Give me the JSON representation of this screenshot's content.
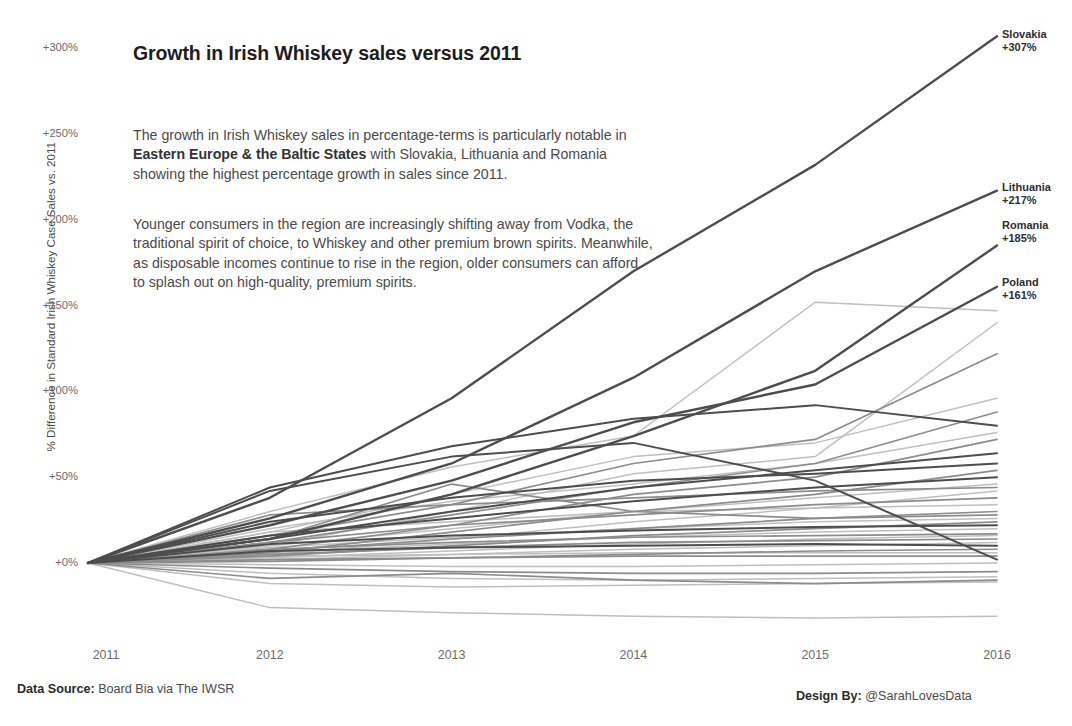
{
  "title": "Growth in Irish Whiskey sales versus 2011",
  "paragraphs": {
    "p1_a": "The growth in Irish Whiskey sales in percentage-terms is particularly notable in ",
    "p1_b": "Eastern Europe & the Baltic States",
    "p1_c": " with Slovakia, Lithuania and Romania showing the highest percentage growth in sales since 2011.",
    "p2": "Younger consumers in the region are increasingly shifting away from Vodka, the traditional spirit of choice, to Whiskey and other premium brown spirits. Meanwhile, as disposable incomes continue to rise in the region, older consumers can afford to splash out on high-quality, premium spirits."
  },
  "footer": {
    "source_label": "Data Source:",
    "source_value": " Board Bia via The IWSR",
    "design_label": "Design By:",
    "design_value": " @SarahLovesData"
  },
  "chart_data": {
    "type": "line",
    "title": "Growth in Irish Whiskey sales versus 2011",
    "xlabel": "",
    "ylabel": "% Difference in Standard Irish Whiskey Case Sales vs. 2011",
    "x": [
      "2011",
      "2012",
      "2013",
      "2014",
      "2015",
      "2016"
    ],
    "xtick_labels": [
      "2011",
      "2012",
      "2013",
      "2014",
      "2015",
      "2016"
    ],
    "ytick_labels": [
      "+0%",
      "+50%",
      "+100%",
      "+150%",
      "+200%",
      "+250%",
      "+300%"
    ],
    "ytick_values": [
      0,
      50,
      100,
      150,
      200,
      250,
      300
    ],
    "ylim": [
      -40,
      310
    ],
    "grid": false,
    "legend": "none",
    "annotations": [
      {
        "name": "Slovakia",
        "value": "+307%"
      },
      {
        "name": "Lithuania",
        "value": "+217%"
      },
      {
        "name": "Romania",
        "value": "+185%"
      },
      {
        "name": "Poland",
        "value": "+161%"
      }
    ],
    "colors": {
      "dark": "#4d4d4d",
      "mid": "#8c8c8c",
      "light": "#bfbfbf",
      "background": "#ffffff",
      "text": "#4a4a4a"
    },
    "series": [
      {
        "name": "Slovakia",
        "values": [
          0,
          38,
          96,
          170,
          232,
          307
        ],
        "tone": "dark",
        "highlight": true
      },
      {
        "name": "Lithuania",
        "values": [
          0,
          26,
          58,
          108,
          170,
          217
        ],
        "tone": "dark",
        "highlight": true
      },
      {
        "name": "Romania",
        "values": [
          0,
          14,
          40,
          74,
          112,
          185
        ],
        "tone": "dark",
        "highlight": true
      },
      {
        "name": "Poland",
        "values": [
          0,
          22,
          48,
          82,
          104,
          161
        ],
        "tone": "dark",
        "highlight": true
      },
      {
        "name": "Series 5",
        "values": [
          0,
          30,
          56,
          74,
          152,
          147
        ],
        "tone": "light",
        "highlight": false
      },
      {
        "name": "Series 6",
        "values": [
          0,
          10,
          30,
          52,
          62,
          140
        ],
        "tone": "light",
        "highlight": false
      },
      {
        "name": "Series 7",
        "values": [
          0,
          16,
          34,
          58,
          72,
          122
        ],
        "tone": "mid",
        "highlight": false
      },
      {
        "name": "Series 8",
        "values": [
          0,
          18,
          40,
          62,
          70,
          96
        ],
        "tone": "light",
        "highlight": false
      },
      {
        "name": "Series 9",
        "values": [
          0,
          12,
          28,
          44,
          58,
          88
        ],
        "tone": "mid",
        "highlight": false
      },
      {
        "name": "Series 10",
        "values": [
          0,
          44,
          68,
          84,
          92,
          80
        ],
        "tone": "dark",
        "highlight": false
      },
      {
        "name": "Series 11",
        "values": [
          0,
          20,
          36,
          46,
          58,
          76
        ],
        "tone": "light",
        "highlight": false
      },
      {
        "name": "Series 12",
        "values": [
          0,
          8,
          22,
          40,
          50,
          72
        ],
        "tone": "mid",
        "highlight": false
      },
      {
        "name": "Series 13",
        "values": [
          0,
          14,
          30,
          44,
          54,
          64
        ],
        "tone": "dark",
        "highlight": false
      },
      {
        "name": "Series 14",
        "values": [
          0,
          24,
          38,
          48,
          52,
          58
        ],
        "tone": "dark",
        "highlight": false
      },
      {
        "name": "Series 15",
        "values": [
          0,
          6,
          18,
          30,
          40,
          54
        ],
        "tone": "mid",
        "highlight": false
      },
      {
        "name": "Series 16",
        "values": [
          0,
          16,
          26,
          36,
          44,
          50
        ],
        "tone": "dark",
        "highlight": false
      },
      {
        "name": "Series 17",
        "values": [
          0,
          10,
          20,
          30,
          38,
          46
        ],
        "tone": "light",
        "highlight": false
      },
      {
        "name": "Series 18",
        "values": [
          0,
          28,
          34,
          38,
          42,
          44
        ],
        "tone": "mid",
        "highlight": false
      },
      {
        "name": "Series 19",
        "values": [
          0,
          5,
          14,
          24,
          32,
          42
        ],
        "tone": "light",
        "highlight": false
      },
      {
        "name": "Series 20",
        "values": [
          0,
          12,
          22,
          28,
          34,
          38
        ],
        "tone": "mid",
        "highlight": false
      },
      {
        "name": "Series 21",
        "values": [
          0,
          18,
          24,
          30,
          32,
          34
        ],
        "tone": "light",
        "highlight": false
      },
      {
        "name": "Series 22",
        "values": [
          0,
          7,
          14,
          20,
          26,
          30
        ],
        "tone": "mid",
        "highlight": false
      },
      {
        "name": "Series 23",
        "values": [
          0,
          14,
          46,
          30,
          26,
          28
        ],
        "tone": "mid",
        "highlight": false
      },
      {
        "name": "Series 24",
        "values": [
          0,
          9,
          15,
          20,
          24,
          26
        ],
        "tone": "light",
        "highlight": false
      },
      {
        "name": "Series 25",
        "values": [
          0,
          4,
          10,
          16,
          20,
          24
        ],
        "tone": "mid",
        "highlight": false
      },
      {
        "name": "Series 26",
        "values": [
          0,
          11,
          16,
          19,
          21,
          22
        ],
        "tone": "dark",
        "highlight": false
      },
      {
        "name": "Series 27",
        "values": [
          0,
          6,
          11,
          15,
          18,
          20
        ],
        "tone": "light",
        "highlight": false
      },
      {
        "name": "Series 28",
        "values": [
          0,
          8,
          12,
          15,
          16,
          17
        ],
        "tone": "mid",
        "highlight": false
      },
      {
        "name": "Series 29",
        "values": [
          0,
          3,
          7,
          11,
          14,
          16
        ],
        "tone": "light",
        "highlight": false
      },
      {
        "name": "Series 30",
        "values": [
          0,
          5,
          9,
          12,
          13,
          14
        ],
        "tone": "mid",
        "highlight": false
      },
      {
        "name": "Series 31",
        "values": [
          0,
          2,
          5,
          8,
          10,
          12
        ],
        "tone": "light",
        "highlight": false
      },
      {
        "name": "Series 32",
        "values": [
          0,
          7,
          9,
          10,
          11,
          10
        ],
        "tone": "dark",
        "highlight": false
      },
      {
        "name": "Series 33",
        "values": [
          0,
          1,
          3,
          5,
          7,
          8
        ],
        "tone": "mid",
        "highlight": false
      },
      {
        "name": "Series 34",
        "values": [
          0,
          4,
          5,
          6,
          6,
          6
        ],
        "tone": "light",
        "highlight": false
      },
      {
        "name": "Series 35",
        "values": [
          0,
          2,
          3,
          4,
          4,
          4
        ],
        "tone": "mid",
        "highlight": false
      },
      {
        "name": "Series 36",
        "values": [
          0,
          42,
          62,
          70,
          48,
          2
        ],
        "tone": "dark",
        "highlight": false
      },
      {
        "name": "Series 37",
        "values": [
          0,
          -1,
          -2,
          -2,
          -1,
          0
        ],
        "tone": "light",
        "highlight": false
      },
      {
        "name": "Series 38",
        "values": [
          0,
          -3,
          -5,
          -6,
          -6,
          -5
        ],
        "tone": "mid",
        "highlight": false
      },
      {
        "name": "Series 39",
        "values": [
          0,
          -6,
          -9,
          -10,
          -9,
          -8
        ],
        "tone": "light",
        "highlight": false
      },
      {
        "name": "Series 40",
        "values": [
          0,
          -9,
          -6,
          -10,
          -12,
          -10
        ],
        "tone": "mid",
        "highlight": false
      },
      {
        "name": "Series 41",
        "values": [
          0,
          -12,
          -14,
          -13,
          -12,
          -11
        ],
        "tone": "light",
        "highlight": false
      },
      {
        "name": "Series 42",
        "values": [
          0,
          -26,
          -29,
          -31,
          -32,
          -31
        ],
        "tone": "light",
        "highlight": false
      }
    ]
  }
}
